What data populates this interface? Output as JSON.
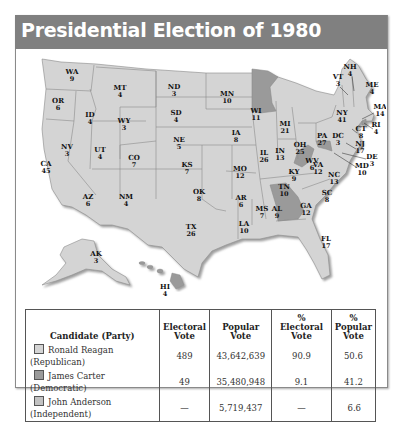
{
  "title": "Presidential Election of 1980",
  "colors": {
    "reagan": "#d4d4d4",
    "carter": "#9a9a9a",
    "anderson": "#c2c2c2",
    "title_bar": "#808080",
    "border": "#555555"
  },
  "states": [
    {
      "abbr": "WA",
      "ev": "9",
      "winner": "Reagan"
    },
    {
      "abbr": "OR",
      "ev": "6",
      "winner": "Reagan"
    },
    {
      "abbr": "CA",
      "ev": "45",
      "winner": "Reagan"
    },
    {
      "abbr": "ID",
      "ev": "4",
      "winner": "Reagan"
    },
    {
      "abbr": "NV",
      "ev": "3",
      "winner": "Reagan"
    },
    {
      "abbr": "MT",
      "ev": "4",
      "winner": "Reagan"
    },
    {
      "abbr": "WY",
      "ev": "3",
      "winner": "Reagan"
    },
    {
      "abbr": "UT",
      "ev": "4",
      "winner": "Reagan"
    },
    {
      "abbr": "AZ",
      "ev": "6",
      "winner": "Reagan"
    },
    {
      "abbr": "CO",
      "ev": "7",
      "winner": "Reagan"
    },
    {
      "abbr": "NM",
      "ev": "4",
      "winner": "Reagan"
    },
    {
      "abbr": "ND",
      "ev": "3",
      "winner": "Reagan"
    },
    {
      "abbr": "SD",
      "ev": "4",
      "winner": "Reagan"
    },
    {
      "abbr": "NE",
      "ev": "5",
      "winner": "Reagan"
    },
    {
      "abbr": "KS",
      "ev": "7",
      "winner": "Reagan"
    },
    {
      "abbr": "OK",
      "ev": "8",
      "winner": "Reagan"
    },
    {
      "abbr": "TX",
      "ev": "26",
      "winner": "Reagan"
    },
    {
      "abbr": "MN",
      "ev": "10",
      "winner": "Carter"
    },
    {
      "abbr": "IA",
      "ev": "8",
      "winner": "Reagan"
    },
    {
      "abbr": "MO",
      "ev": "12",
      "winner": "Reagan"
    },
    {
      "abbr": "AR",
      "ev": "6",
      "winner": "Reagan"
    },
    {
      "abbr": "LA",
      "ev": "10",
      "winner": "Reagan"
    },
    {
      "abbr": "WI",
      "ev": "11",
      "winner": "Reagan"
    },
    {
      "abbr": "IL",
      "ev": "26",
      "winner": "Reagan"
    },
    {
      "abbr": "MI",
      "ev": "21",
      "winner": "Reagan"
    },
    {
      "abbr": "IN",
      "ev": "13",
      "winner": "Reagan"
    },
    {
      "abbr": "OH",
      "ev": "25",
      "winner": "Reagan"
    },
    {
      "abbr": "KY",
      "ev": "9",
      "winner": "Reagan"
    },
    {
      "abbr": "TN",
      "ev": "10",
      "winner": "Reagan"
    },
    {
      "abbr": "MS",
      "ev": "7",
      "winner": "Reagan"
    },
    {
      "abbr": "AL",
      "ev": "9",
      "winner": "Reagan"
    },
    {
      "abbr": "GA",
      "ev": "12",
      "winner": "Carter"
    },
    {
      "abbr": "FL",
      "ev": "17",
      "winner": "Reagan"
    },
    {
      "abbr": "SC",
      "ev": "8",
      "winner": "Reagan"
    },
    {
      "abbr": "NC",
      "ev": "13",
      "winner": "Reagan"
    },
    {
      "abbr": "VA",
      "ev": "12",
      "winner": "Reagan"
    },
    {
      "abbr": "WV",
      "ev": "6",
      "winner": "Carter"
    },
    {
      "abbr": "PA",
      "ev": "27",
      "winner": "Reagan"
    },
    {
      "abbr": "DC",
      "ev": "3",
      "winner": "Carter"
    },
    {
      "abbr": "MD",
      "ev": "10",
      "winner": "Carter"
    },
    {
      "abbr": "DE",
      "ev": "3",
      "winner": "Reagan"
    },
    {
      "abbr": "NJ",
      "ev": "17",
      "winner": "Reagan"
    },
    {
      "abbr": "NY",
      "ev": "41",
      "winner": "Reagan"
    },
    {
      "abbr": "CT",
      "ev": "8",
      "winner": "Reagan"
    },
    {
      "abbr": "RI",
      "ev": "4",
      "winner": "Carter"
    },
    {
      "abbr": "MA",
      "ev": "14",
      "winner": "Reagan"
    },
    {
      "abbr": "VT",
      "ev": "3",
      "winner": "Reagan"
    },
    {
      "abbr": "NH",
      "ev": "4",
      "winner": "Reagan"
    },
    {
      "abbr": "ME",
      "ev": "4",
      "winner": "Reagan"
    },
    {
      "abbr": "AK",
      "ev": "3",
      "winner": "Reagan"
    },
    {
      "abbr": "HI",
      "ev": "4",
      "winner": "Carter"
    }
  ],
  "table": {
    "headers": [
      "Candidate (Party)",
      "Electoral Vote",
      "Popular Vote",
      "% Electoral Vote",
      "% Popular Vote"
    ],
    "rows": [
      {
        "candidate": "Ronald Reagan (Republican)",
        "swatch": "reagan",
        "electoral": "489",
        "popular": "43,642,639",
        "pct_electoral": "90.9",
        "pct_popular": "50.6"
      },
      {
        "candidate": "James Carter (Democratic)",
        "swatch": "carter",
        "electoral": "49",
        "popular": "35,480,948",
        "pct_electoral": "9.1",
        "pct_popular": "41.2"
      },
      {
        "candidate": "John Anderson (Independent)",
        "swatch": "anderson",
        "electoral": "—",
        "popular": "5,719,437",
        "pct_electoral": "—",
        "pct_popular": "6.6"
      }
    ]
  }
}
